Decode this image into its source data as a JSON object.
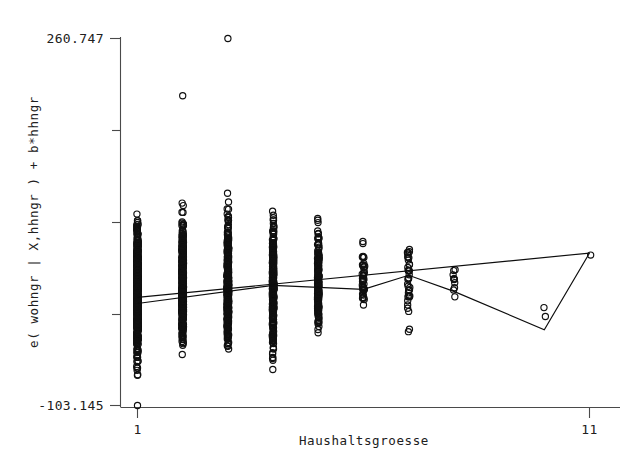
{
  "figure": {
    "background_color": "#ffffff",
    "ink_color": "#101010",
    "axis_color": "#4a4a4a",
    "width": 643,
    "height": 472
  },
  "chart_data": {
    "type": "scatter",
    "title": "",
    "subtitle": "",
    "xlabel": "Haushaltsgroesse",
    "ylabel": "e( wohngr | X,hhngr ) + b*hhngr",
    "xlim": [
      1,
      11
    ],
    "ylim": [
      -103.145,
      260.747
    ],
    "x_tick_labels": [
      "1",
      "11"
    ],
    "x_tick_values": [
      1,
      11
    ],
    "y_tick_labels": [
      "260.747",
      "-103.145"
    ],
    "y_tick_values": [
      260.747,
      -103.145
    ],
    "y_minor_tick_count": 3,
    "grid": false,
    "legend": null,
    "legend_position": "none",
    "marker_style": "open-circle",
    "marker_radius_px": 3.1,
    "categories": [
      1,
      2,
      3,
      4,
      5,
      6,
      7,
      8,
      9,
      10,
      11
    ],
    "series": [
      {
        "name": "observations",
        "kind": "scatter",
        "note": "Dense vertical strips of open circles at each integer household size; counts fall sharply with household size.",
        "column_summary": [
          {
            "x": 1,
            "n": 620,
            "y_min": -93.0,
            "y_max": 112.0,
            "y_median": 8.0,
            "outliers": [
              -103.145
            ]
          },
          {
            "x": 2,
            "n": 560,
            "y_min": -68.0,
            "y_max": 118.0,
            "y_median": 12.0,
            "outliers": [
              204.0
            ]
          },
          {
            "x": 3,
            "n": 430,
            "y_min": -78.0,
            "y_max": 122.0,
            "y_median": 14.0,
            "outliers": [
              260.747
            ]
          },
          {
            "x": 4,
            "n": 300,
            "y_min": -92.0,
            "y_max": 128.0,
            "y_median": 16.0,
            "outliers": []
          },
          {
            "x": 5,
            "n": 160,
            "y_min": -56.0,
            "y_max": 108.0,
            "y_median": 18.0,
            "outliers": []
          },
          {
            "x": 6,
            "n": 44,
            "y_min": -24.0,
            "y_max": 84.0,
            "y_median": 22.0,
            "outliers": []
          },
          {
            "x": 7,
            "n": 36,
            "y_min": -70.0,
            "y_max": 92.0,
            "y_median": 28.0,
            "outliers": []
          },
          {
            "x": 8,
            "n": 10,
            "y_min": -16.0,
            "y_max": 46.0,
            "y_median": 24.0,
            "outliers": []
          },
          {
            "x": 10,
            "n": 2,
            "y_min": -24.0,
            "y_max": 6.0,
            "y_median": -9.0,
            "outliers": []
          },
          {
            "x": 11,
            "n": 1,
            "y_min": 46.0,
            "y_max": 46.0,
            "y_median": 46.0,
            "outliers": []
          }
        ]
      },
      {
        "name": "linear fit",
        "kind": "line",
        "style": "straight",
        "points": [
          [
            1,
            4.0
          ],
          [
            11,
            48.0
          ]
        ]
      },
      {
        "name": "lowess / median fit",
        "kind": "line",
        "style": "piecewise",
        "points": [
          [
            1,
            -2.0
          ],
          [
            4,
            16.0
          ],
          [
            6,
            12.0
          ],
          [
            7,
            26.0
          ],
          [
            8,
            10.0
          ],
          [
            10,
            -28.0
          ],
          [
            11,
            48.0
          ]
        ]
      }
    ]
  }
}
